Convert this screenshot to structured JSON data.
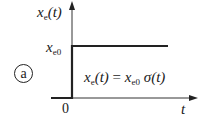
{
  "figure": {
    "label": "a",
    "y_axis": {
      "var": "x",
      "sub": "e",
      "arg": "(t)"
    },
    "level_label": {
      "var": "x",
      "sub": "e0"
    },
    "x_axis": {
      "label": "t",
      "origin": "0"
    },
    "equation": {
      "lhs_var": "x",
      "lhs_sub": "e",
      "lhs_arg": "(t)",
      "eq": " = ",
      "rhs_var": "x",
      "rhs_sub": "e0",
      "rhs_func": " σ",
      "rhs_arg": "(t)"
    },
    "colors": {
      "signal": "#222222",
      "axis": "#333333"
    }
  }
}
